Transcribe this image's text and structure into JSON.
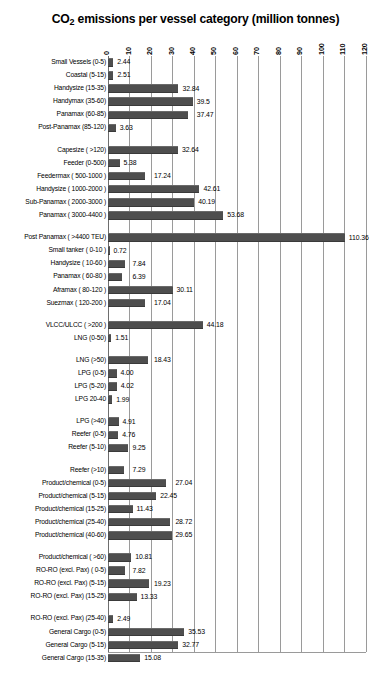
{
  "chart_data": {
    "type": "bar",
    "orientation": "horizontal",
    "title": "CO2 emissions per vessel category  (million tonnes)",
    "title_main": "CO",
    "title_sub": "2",
    "title_rest": " emissions per vessel category  (million tonnes)",
    "xlabel": "",
    "ylabel": "",
    "xlim": [
      0,
      120
    ],
    "xticks": [
      0,
      10,
      20,
      30,
      40,
      50,
      60,
      70,
      80,
      90,
      100,
      110,
      120
    ],
    "xtick_labels": [
      "0",
      "10",
      "20",
      "30",
      "40",
      "50",
      "60",
      "70",
      "80",
      "90",
      "100",
      "110",
      "120"
    ],
    "grid": true,
    "grid_axis": "x",
    "legend": "none",
    "bar_color": "#4e4e4e",
    "categories": [
      "Small Vessels (0-5)",
      "Coastal  (5-15)",
      "Handysize (15-35)",
      "Handymax  (35-60)",
      "Panamax (60-85)",
      "Post-Panamax (85-120)",
      "Capesize ( >120)",
      "Feeder (0-500)",
      "Feedermax ( 500-1000 )",
      "Handysize ( 1000-2000 )",
      "Sub-Panamax ( 2000-3000 )",
      "Panamax ( 3000-4400 )",
      "Post Panamax ( >4400 TEU)",
      "Small tanker ( 0-10 )",
      "Handysize ( 10-60 )",
      "Panamax   ( 60-80 )",
      "Aframax      ( 80-120 )",
      "Suezmax      ( 120-200 )",
      "VLCC/ULCC    ( >200 )",
      "LNG (0-50)",
      "LNG (>50)",
      "LPG  (0-5)",
      "LPG  (5-20)",
      "LPG 20-40",
      "LPG (>40)",
      "Reefer (0-5)",
      "Reefer (5-10)",
      "Reefer (>10)",
      "Product/chemical (0-5)",
      "Product/chemical (5-15)",
      "Product/chemical (15-25)",
      "Product/chemical (25-40)",
      "Product/chemical (40-60)",
      "Product/chemical ( >60)",
      "RO-RO (excl. Pax) ( 0-5)",
      "RO-RO (excl. Pax)  (5-15)",
      "RO-RO (excl. Pax) (15-25)",
      "RO-RO (excl. Pax)  (25-40)",
      "General Cargo (0-5)",
      "General Cargo (5-15)",
      "General Cargo (15-35)"
    ],
    "values": [
      2.44,
      2.51,
      32.84,
      39.5,
      37.47,
      3.63,
      32.64,
      5.38,
      17.24,
      42.61,
      40.19,
      53.68,
      110.36,
      0.72,
      7.84,
      6.39,
      30.11,
      17.04,
      44.18,
      1.51,
      18.43,
      4.0,
      4.02,
      1.99,
      4.91,
      4.76,
      9.25,
      7.29,
      27.04,
      22.45,
      11.43,
      28.72,
      29.65,
      10.81,
      7.82,
      19.23,
      13.33,
      2.49,
      35.53,
      32.77,
      15.08
    ],
    "value_labels": [
      "2.44",
      "2.51",
      "32.84",
      "39.5",
      "37.47",
      "3.63",
      "32.64",
      "5.38",
      "17.24",
      "42.61",
      "40.19",
      "53.68",
      "110.36",
      "0.72",
      "7.84",
      "6.39",
      "30.11",
      "17.04",
      "44.18",
      "1.51",
      "18.43",
      "4.00",
      "4.02",
      "1.99",
      "4.91",
      "4.76",
      "9.25",
      "7.29",
      "27.04",
      "22.45",
      "11.43",
      "28.72",
      "29.65",
      "10.81",
      "7.82",
      "19.23",
      "13.33",
      "2.49",
      "35.53",
      "32.77",
      "15.08"
    ],
    "group_breaks_after": [
      6,
      12,
      18,
      20,
      24,
      27,
      33,
      37
    ],
    "groups": [
      {
        "name": "Bulk carriers",
        "categories": [
          "Small Vessels (0-5)",
          "Coastal  (5-15)",
          "Handysize (15-35)",
          "Handymax  (35-60)",
          "Panamax (60-85)",
          "Post-Panamax (85-120)",
          "Capesize ( >120)"
        ],
        "values": [
          2.44,
          2.51,
          32.84,
          39.5,
          37.47,
          3.63,
          32.64
        ]
      },
      {
        "name": "Container",
        "categories": [
          "Feeder (0-500)",
          "Feedermax ( 500-1000 )",
          "Handysize ( 1000-2000 )",
          "Sub-Panamax ( 2000-3000 )",
          "Panamax ( 3000-4400 )",
          "Post Panamax ( >4400 TEU)"
        ],
        "values": [
          5.38,
          17.24,
          42.61,
          40.19,
          53.68,
          110.36
        ]
      },
      {
        "name": "Tankers",
        "categories": [
          "Small tanker ( 0-10 )",
          "Handysize ( 10-60 )",
          "Panamax   ( 60-80 )",
          "Aframax      ( 80-120 )",
          "Suezmax      ( 120-200 )",
          "VLCC/ULCC    ( >200 )"
        ],
        "values": [
          0.72,
          7.84,
          6.39,
          30.11,
          17.04,
          44.18
        ]
      },
      {
        "name": "LNG",
        "categories": [
          "LNG (0-50)",
          "LNG (>50)"
        ],
        "values": [
          1.51,
          18.43
        ]
      },
      {
        "name": "LPG",
        "categories": [
          "LPG  (0-5)",
          "LPG  (5-20)",
          "LPG 20-40",
          "LPG (>40)"
        ],
        "values": [
          4.0,
          4.02,
          1.99,
          4.91
        ]
      },
      {
        "name": "Reefer",
        "categories": [
          "Reefer (0-5)",
          "Reefer (5-10)",
          "Reefer (>10)"
        ],
        "values": [
          4.76,
          9.25,
          7.29
        ]
      },
      {
        "name": "Product/chemical",
        "categories": [
          "Product/chemical (0-5)",
          "Product/chemical (5-15)",
          "Product/chemical (15-25)",
          "Product/chemical (25-40)",
          "Product/chemical (40-60)",
          "Product/chemical ( >60)"
        ],
        "values": [
          27.04,
          22.45,
          11.43,
          28.72,
          29.65,
          10.81
        ]
      },
      {
        "name": "RO-RO (excl. Pax)",
        "categories": [
          "RO-RO (excl. Pax) ( 0-5)",
          "RO-RO (excl. Pax)  (5-15)",
          "RO-RO (excl. Pax) (15-25)",
          "RO-RO (excl. Pax)  (25-40)"
        ],
        "values": [
          7.82,
          19.23,
          13.33,
          2.49
        ]
      },
      {
        "name": "General Cargo",
        "categories": [
          "General Cargo (0-5)",
          "General Cargo (5-15)",
          "General Cargo (15-35)"
        ],
        "values": [
          35.53,
          32.77,
          15.08
        ]
      }
    ]
  },
  "caption": ""
}
